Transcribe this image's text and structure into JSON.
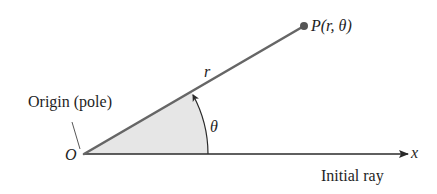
{
  "diagram": {
    "type": "polar-coordinates",
    "labels": {
      "point": "P(r, θ)",
      "radius": "r",
      "angle": "θ",
      "origin_caption": "Origin (pole)",
      "origin": "O",
      "axis": "x",
      "initial_ray": "Initial ray"
    },
    "colors": {
      "ray": "#666666",
      "axis": "#2a2a2a",
      "sector_fill": "#e6e6e6",
      "text": "#1e1e1e",
      "point": "#555555"
    }
  }
}
